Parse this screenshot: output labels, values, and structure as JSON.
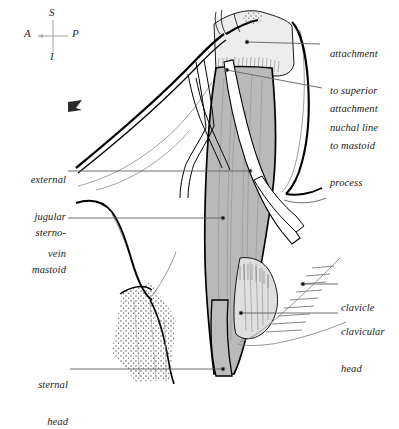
{
  "figure": {
    "background_color": "#ffffff",
    "ink_color": "#000000",
    "colors": {
      "outline": "#000000",
      "muscle_belly_gray": "#b9b9b9",
      "aponeurosis_light_gray": "#ededed",
      "clavicular_head_gray": "#dcdcdc",
      "leader_line_gray": "#6e6e6e",
      "thin_line_gray": "#8a8a8a",
      "stipple": "#3a3a3a"
    }
  },
  "compass": {
    "name": "orientation-compass",
    "superior": "S",
    "inferior": "I",
    "anterior": "A",
    "posterior": "P"
  },
  "labels": [
    {
      "id": "attachment-superior-nuchal-line",
      "lines": [
        "attachment",
        "to superior",
        "nuchal line"
      ],
      "align": "left",
      "x": 330,
      "y": 24,
      "leader": {
        "x1": 320,
        "y1": 44,
        "x2": 247,
        "y2": 42
      }
    },
    {
      "id": "attachment-mastoid-process",
      "lines": [
        "attachment",
        "to mastoid",
        "process"
      ],
      "align": "left",
      "x": 330,
      "y": 79,
      "leader": {
        "x1": 322,
        "y1": 88,
        "x2": 227,
        "y2": 70
      }
    },
    {
      "id": "external-jugular-vein",
      "lines": [
        "external",
        "jugular",
        "vein"
      ],
      "align": "right",
      "x": 16,
      "y": 150,
      "leader": {
        "x1": 68,
        "y1": 171,
        "x2": 250,
        "y2": 171
      }
    },
    {
      "id": "sternomastoid",
      "lines": [
        "sterno-",
        "mastoid"
      ],
      "align": "right",
      "x": 16,
      "y": 203,
      "leader": {
        "x1": 68,
        "y1": 218,
        "x2": 223,
        "y2": 218
      }
    },
    {
      "id": "clavicle",
      "lines": [
        "clavicle"
      ],
      "align": "left",
      "x": 341,
      "y": 278,
      "leader": {
        "x1": 338,
        "y1": 284,
        "x2": 303,
        "y2": 284
      }
    },
    {
      "id": "clavicular-head",
      "lines": [
        "clavicular",
        "head"
      ],
      "align": "left",
      "x": 341,
      "y": 302,
      "leader": {
        "x1": 338,
        "y1": 313,
        "x2": 241,
        "y2": 313
      }
    },
    {
      "id": "sternal-head",
      "lines": [
        "sternal",
        "head"
      ],
      "align": "right",
      "x": 16,
      "y": 355,
      "leader": {
        "x1": 70,
        "y1": 369,
        "x2": 223,
        "y2": 369
      }
    }
  ],
  "structures": [
    {
      "id": "sternomastoid-belly",
      "shading": "medium-gray",
      "description": "main muscle belly with longitudinal fiber lines"
    },
    {
      "id": "superior-aponeurosis",
      "shading": "light-gray",
      "description": "attachment to superior nuchal line and mastoid process"
    },
    {
      "id": "clavicular-head",
      "shading": "light-gray",
      "description": "fanning inferior-lateral head"
    },
    {
      "id": "sternal-head",
      "shading": "medium-gray",
      "description": "narrow inferior-medial head"
    },
    {
      "id": "external-jugular-vein",
      "shading": "white-outlined",
      "description": "vein crossing the muscle obliquely"
    },
    {
      "id": "mandible-edge",
      "shading": "thick-outline",
      "description": "jaw line sweeping anteriorly"
    },
    {
      "id": "clavicle",
      "shading": "hatched",
      "description": "diagonal hatch lines inferolateral"
    },
    {
      "id": "sternum-cartilage",
      "shading": "stippled",
      "description": "stippled triangular region inferomedial"
    }
  ]
}
